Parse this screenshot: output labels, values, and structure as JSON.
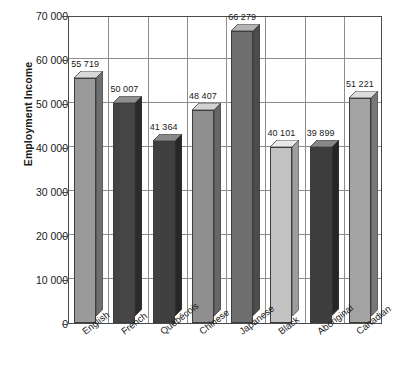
{
  "chart_data": {
    "type": "bar",
    "title": "",
    "subtitle": "",
    "xlabel": "",
    "ylabel": "Employment Income",
    "ylim": [
      0,
      70000
    ],
    "yticks": [
      0,
      10000,
      20000,
      30000,
      40000,
      50000,
      60000,
      70000
    ],
    "ytick_labels": [
      "0",
      "10 000",
      "20 000",
      "30 000",
      "40 000",
      "50 000",
      "60 000",
      "70 000"
    ],
    "grid": "both",
    "legend": "none",
    "three_d": true,
    "categories": [
      "English",
      "French",
      "Québécois",
      "Chinese",
      "Japanese",
      "Black",
      "Aboriginal",
      "Canadian"
    ],
    "values": [
      55719,
      50007,
      41364,
      48407,
      66279,
      40101,
      39899,
      51221
    ],
    "value_labels": [
      "55 719",
      "50 007",
      "41 364",
      "48 407",
      "66 279",
      "40 101",
      "39 899",
      "51 221"
    ],
    "bar_colors": [
      "#9a9a9a",
      "#454545",
      "#3f3f3f",
      "#8f8f8f",
      "#6e6e6e",
      "#c2c2c2",
      "#3d3d3d",
      "#a3a3a3"
    ],
    "bar_top_colors": [
      "#d8d8d8",
      "#8f8f8f",
      "#8a8a8a",
      "#d2d2d2",
      "#b4b4b4",
      "#eaeaea",
      "#888888",
      "#dcdcdc"
    ],
    "bar_side_colors": [
      "#6f6f6f",
      "#2b2b2b",
      "#272727",
      "#666666",
      "#4c4c4c",
      "#9d9d9d",
      "#262626",
      "#787878"
    ]
  }
}
